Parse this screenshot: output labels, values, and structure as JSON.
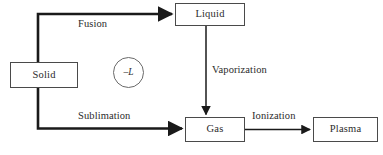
{
  "diagram": {
    "type": "flow-diagram",
    "background_color": "#ffffff",
    "stroke_color": "#1a1a1a",
    "box_border_color": "#4a4a4a",
    "text_color": "#2b2b2b",
    "nodes": [
      {
        "id": "solid",
        "label": "Solid"
      },
      {
        "id": "liquid",
        "label": "Liquid"
      },
      {
        "id": "gas",
        "label": "Gas"
      },
      {
        "id": "plasma",
        "label": "Plasma"
      }
    ],
    "edges": [
      {
        "id": "fusion",
        "label": "Fusion",
        "from": "solid",
        "to": "liquid",
        "weight": "thick"
      },
      {
        "id": "vaporization",
        "label": "Vaporization",
        "from": "liquid",
        "to": "gas",
        "weight": "thin"
      },
      {
        "id": "sublimation",
        "label": "Sublimation",
        "from": "solid",
        "to": "gas",
        "weight": "thick"
      },
      {
        "id": "ionization",
        "label": "Ionization",
        "from": "gas",
        "to": "plasma",
        "weight": "thin"
      }
    ],
    "annotation": {
      "id": "latent-heat",
      "label": "–L",
      "shape": "circle"
    }
  }
}
